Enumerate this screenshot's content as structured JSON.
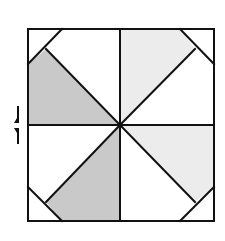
{
  "diagram": {
    "type": "pinwheel-square-fold",
    "colors": {
      "stroke": "#111111",
      "dark_fill": "#c9c9c9",
      "light_fill": "#ececec",
      "background": "#ffffff"
    },
    "square": {
      "x": 28,
      "y": 29,
      "size_w": 186,
      "size_h": 192
    },
    "center": {
      "x": 120,
      "y": 125
    },
    "shaded_regions": [
      {
        "name": "left-upper-triangle",
        "shade": "dark"
      },
      {
        "name": "top-right-triangle",
        "shade": "light"
      },
      {
        "name": "right-lower-triangle",
        "shade": "light"
      },
      {
        "name": "bottom-left-triangle",
        "shade": "dark"
      }
    ],
    "fold_arrow": {
      "orientation": "vertical",
      "position": "left"
    }
  }
}
